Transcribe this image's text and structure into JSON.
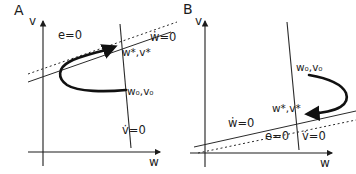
{
  "figure": {
    "background": "#ffffff",
    "ink": "#1c1c1c",
    "panels": [
      {
        "panel_label": "A",
        "y_axis_label": "v",
        "x_axis_label": "w",
        "labels": {
          "e_nullcline": "e=0",
          "w_nullcline": "ẇ=0",
          "v_nullcline": "v̇=0",
          "fixed_point": "w*,v*",
          "initial_point": "w₀,v₀"
        }
      },
      {
        "panel_label": "B",
        "y_axis_label": "v",
        "x_axis_label": "w",
        "labels": {
          "e_nullcline": "e=0",
          "w_nullcline": "ẇ=0",
          "v_nullcline": "v̇=0",
          "fixed_point": "w*,v*",
          "initial_point": "w₀,v₀"
        }
      }
    ]
  }
}
